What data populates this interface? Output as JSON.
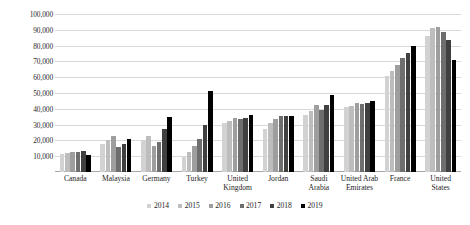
{
  "chart_data": {
    "type": "bar",
    "title": "",
    "xlabel": "",
    "ylabel": "",
    "ylim": [
      0,
      100000
    ],
    "grid": true,
    "legend_position": "bottom",
    "categories": [
      "Canada",
      "Malaysia",
      "Germany",
      "Turkey",
      "United Kingdom",
      "Jordan",
      "Saudi Arabia",
      "United Arab Emirates",
      "France",
      "United States"
    ],
    "ytick_labels": [
      "100,000",
      "90,000",
      "80,000",
      "70,000",
      "60,000",
      "50,000",
      "40,000",
      "30,000",
      "20,000",
      "10,000"
    ],
    "ytick_values": [
      100000,
      90000,
      80000,
      70000,
      60000,
      50000,
      40000,
      30000,
      20000,
      10000
    ],
    "series": [
      {
        "name": "2014",
        "color": "#d2d2d2",
        "values": [
          11500,
          18000,
          20500,
          9500,
          31000,
          27000,
          36000,
          41000,
          61000,
          86000
        ]
      },
      {
        "name": "2015",
        "color": "#bdbdbd",
        "values": [
          12000,
          20000,
          23000,
          12500,
          32500,
          31000,
          38500,
          42000,
          64000,
          91000
        ]
      },
      {
        "name": "2016",
        "color": "#9e9e9e",
        "values": [
          12500,
          23000,
          16500,
          16500,
          34000,
          33500,
          42500,
          43500,
          67500,
          91500
        ]
      },
      {
        "name": "2017",
        "color": "#6e6e6e",
        "values": [
          12500,
          16000,
          19000,
          21000,
          33500,
          35500,
          39000,
          43000,
          72000,
          88500
        ]
      },
      {
        "name": "2018",
        "color": "#404040",
        "values": [
          13000,
          18000,
          27500,
          29500,
          34000,
          35500,
          42500,
          43500,
          75500,
          83500
        ]
      },
      {
        "name": "2019",
        "color": "#000000",
        "values": [
          10500,
          21000,
          35000,
          51000,
          36000,
          35500,
          49000,
          45000,
          80000,
          71000
        ]
      }
    ]
  }
}
